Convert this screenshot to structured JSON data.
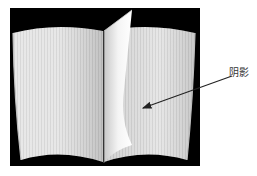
{
  "figure": {
    "background_frame_color": "#000000",
    "page_color": "#e6e6e6",
    "annotation": {
      "label": "阴影",
      "arrow_color": "#222222"
    }
  }
}
